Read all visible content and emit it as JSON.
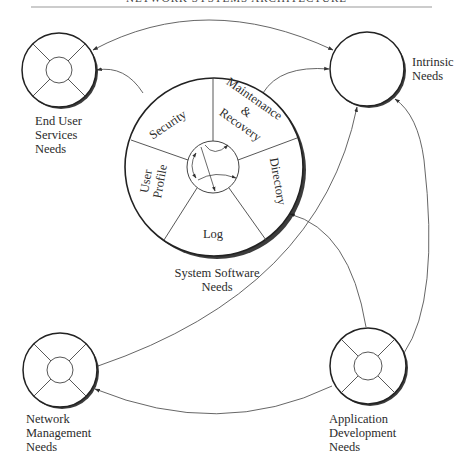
{
  "header": {
    "running_title": "NETWORK SYSTEMS ARCHITECTURE"
  },
  "diagram": {
    "central": {
      "label_lines": [
        "System Software",
        "Needs"
      ],
      "segments": [
        {
          "id": "security",
          "label": "Security"
        },
        {
          "id": "maintenance",
          "label_lines": [
            "Maintenance",
            "&",
            "Recovery"
          ]
        },
        {
          "id": "directory",
          "label": "Directory"
        },
        {
          "id": "log",
          "label": "Log"
        },
        {
          "id": "user-profile",
          "label_lines": [
            "User",
            "Profile"
          ]
        }
      ]
    },
    "nodes": [
      {
        "id": "end-user",
        "label_lines": [
          "End User",
          "Services",
          "Needs"
        ]
      },
      {
        "id": "intrinsic",
        "label_lines": [
          "Intrinsic",
          "Needs"
        ]
      },
      {
        "id": "network-mgmt",
        "label_lines": [
          "Network",
          "Management",
          "Needs"
        ]
      },
      {
        "id": "app-dev",
        "label_lines": [
          "Application",
          "Development",
          "Needs"
        ]
      }
    ],
    "edges": [
      {
        "from": "intrinsic",
        "to": "end-user",
        "bidirectional": true
      },
      {
        "from": "central",
        "to": "end-user"
      },
      {
        "from": "central",
        "to": "intrinsic"
      },
      {
        "from": "network-mgmt",
        "to": "intrinsic"
      },
      {
        "from": "app-dev",
        "to": "central"
      },
      {
        "from": "app-dev",
        "to": "intrinsic"
      },
      {
        "from": "app-dev",
        "to": "network-mgmt"
      }
    ],
    "colors": {
      "stroke": "#2a2a2a",
      "thin_stroke": "#555555",
      "shadow": "#1a1a1a",
      "text": "#2b2b2b"
    }
  }
}
